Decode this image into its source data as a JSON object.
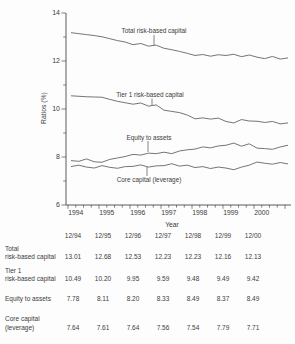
{
  "chart_data": {
    "type": "line",
    "title": "",
    "xlabel": "Year",
    "ylabel": "Ratios (%)",
    "ylim": [
      6,
      14
    ],
    "y_major_ticks": [
      14,
      12,
      10,
      8,
      6
    ],
    "y_minor_ticks": [
      13,
      11,
      9,
      7
    ],
    "x_year_labels": [
      "1994",
      "1995",
      "1996",
      "1997",
      "1998",
      "1999",
      "2000"
    ],
    "x_frequency": "quarterly",
    "x_start": "12/93",
    "x_end": "12/00",
    "grid": false,
    "legend": "inline-annotations",
    "series": [
      {
        "name": "Total risk-based capital",
        "values": [
          13.18,
          13.14,
          13.1,
          13.06,
          13.01,
          12.93,
          12.85,
          12.79,
          12.68,
          12.73,
          12.62,
          12.66,
          12.53,
          12.47,
          12.4,
          12.32,
          12.23,
          12.27,
          12.2,
          12.26,
          12.23,
          12.28,
          12.18,
          12.25,
          12.16,
          12.1,
          12.19,
          12.08,
          12.13
        ]
      },
      {
        "name": "Tier 1 risk-based capital",
        "values": [
          10.55,
          10.53,
          10.51,
          10.5,
          10.49,
          10.4,
          10.32,
          10.26,
          10.2,
          10.25,
          10.12,
          10.17,
          9.95,
          9.9,
          9.85,
          9.75,
          9.59,
          9.63,
          9.58,
          9.62,
          9.48,
          9.42,
          9.56,
          9.5,
          9.49,
          9.44,
          9.48,
          9.38,
          9.42
        ]
      },
      {
        "name": "Equity to assets",
        "values": [
          7.85,
          7.82,
          7.92,
          7.8,
          7.78,
          7.9,
          7.96,
          8.02,
          8.11,
          8.08,
          8.16,
          8.14,
          8.2,
          8.14,
          8.25,
          8.3,
          8.33,
          8.42,
          8.38,
          8.46,
          8.49,
          8.58,
          8.45,
          8.55,
          8.37,
          8.35,
          8.32,
          8.42,
          8.49
        ]
      },
      {
        "name": "Core capital (leverage)",
        "values": [
          7.6,
          7.66,
          7.58,
          7.54,
          7.64,
          7.57,
          7.53,
          7.6,
          7.61,
          7.67,
          7.58,
          7.63,
          7.64,
          7.72,
          7.62,
          7.66,
          7.56,
          7.6,
          7.52,
          7.58,
          7.54,
          7.47,
          7.58,
          7.66,
          7.79,
          7.74,
          7.7,
          7.77,
          7.71
        ]
      }
    ],
    "annotations": [
      {
        "text": "Total risk-based capital",
        "px": [
          154,
          33
        ],
        "leader": [
          154,
          35,
          154,
          45
        ]
      },
      {
        "text": "Tier 1 risk-based capital",
        "px": [
          150,
          96.5
        ],
        "leader": [
          152,
          98.5,
          152,
          105
        ]
      },
      {
        "text": "Equity to assets",
        "px": [
          149,
          139.5
        ],
        "leader": [
          148,
          141,
          148,
          152
        ]
      },
      {
        "text": "Core capital (leverage)",
        "px": [
          149,
          182
        ],
        "leader": [
          147,
          167,
          147,
          176
        ]
      }
    ]
  },
  "table": {
    "columns": [
      "12/94",
      "12/95",
      "12/96",
      "12/97",
      "12/98",
      "12/99",
      "12/00"
    ],
    "rows": [
      {
        "label": [
          "Total",
          "risk-based capital"
        ],
        "values": [
          "13.01",
          "12.68",
          "12.53",
          "12.23",
          "12.23",
          "12.16",
          "12.13"
        ]
      },
      {
        "label": [
          "Tier 1",
          "risk-based capital"
        ],
        "values": [
          "10.49",
          "10.20",
          "9.95",
          "9.59",
          "9.48",
          "9.49",
          "9.42"
        ]
      },
      {
        "label": [
          "Equity to assets"
        ],
        "values": [
          "7.78",
          "8.11",
          "8.20",
          "8.33",
          "8.49",
          "8.37",
          "8.49"
        ]
      },
      {
        "label": [
          "Core capital",
          "(leverage)"
        ],
        "values": [
          "7.64",
          "7.61",
          "7.64",
          "7.56",
          "7.54",
          "7.79",
          "7.71"
        ]
      }
    ]
  }
}
